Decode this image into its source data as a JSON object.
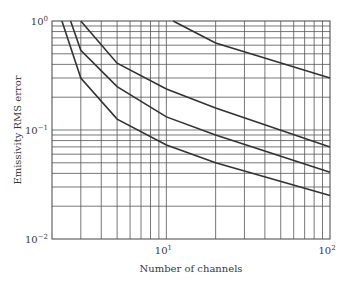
{
  "chart_data": {
    "type": "line",
    "title": "",
    "xlabel": "Number of channels",
    "ylabel": "Emissivity RMS error",
    "xscale": "log",
    "yscale": "log",
    "xlim": [
      2,
      100
    ],
    "ylim": [
      0.01,
      1
    ],
    "grid": true,
    "legend": null,
    "x_ticks": [
      {
        "value": 10,
        "base": "10",
        "exp": "1"
      },
      {
        "value": 100,
        "base": "10",
        "exp": "2"
      }
    ],
    "y_ticks": [
      {
        "value": 1,
        "base": "10",
        "exp": "0"
      },
      {
        "value": 0.1,
        "base": "10",
        "exp": "−1"
      },
      {
        "value": 0.01,
        "base": "10",
        "exp": "−2"
      }
    ],
    "series": [
      {
        "name": "curve-1",
        "x": [
          2.3,
          3,
          5,
          10,
          20,
          100
        ],
        "values": [
          1.0,
          0.3,
          0.126,
          0.073,
          0.05,
          0.025
        ]
      },
      {
        "name": "curve-2",
        "x": [
          2.6,
          3,
          5,
          10,
          20,
          100
        ],
        "values": [
          1.0,
          0.54,
          0.25,
          0.132,
          0.09,
          0.041
        ]
      },
      {
        "name": "curve-3",
        "x": [
          3,
          5,
          10,
          20,
          100
        ],
        "values": [
          1.0,
          0.41,
          0.238,
          0.159,
          0.07
        ]
      },
      {
        "name": "curve-4",
        "x": [
          11,
          20,
          100
        ],
        "values": [
          1.0,
          0.63,
          0.3
        ]
      }
    ]
  },
  "style": {
    "curve_color": "#333333",
    "grid_color": "#555555",
    "text_color": "#3a3a3a"
  }
}
